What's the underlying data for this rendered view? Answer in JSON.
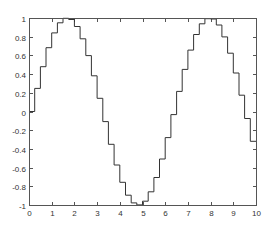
{
  "chart_data": {
    "type": "line",
    "style": "stairs",
    "title": "",
    "xlabel": "",
    "ylabel": "",
    "xlim": [
      0,
      10
    ],
    "ylim": [
      -1,
      1
    ],
    "grid": false,
    "legend": null,
    "x_ticks": [
      0,
      1,
      2,
      3,
      4,
      5,
      6,
      7,
      8,
      9,
      10
    ],
    "y_ticks": [
      -1,
      -0.8,
      -0.6,
      -0.4,
      -0.2,
      0,
      0.2,
      0.4,
      0.6,
      0.8,
      1
    ],
    "x_tick_labels": [
      "0",
      "1",
      "2",
      "3",
      "4",
      "5",
      "6",
      "7",
      "8",
      "9",
      "10"
    ],
    "y_tick_labels": [
      "-1",
      "-0.8",
      "-0.6",
      "-0.4",
      "-0.2",
      "0",
      "0.2",
      "0.4",
      "0.6",
      "0.8",
      "1"
    ],
    "series": [
      {
        "name": "sin(x) stairs",
        "color": "#333333",
        "x": [
          0,
          0.25,
          0.5,
          0.75,
          1,
          1.25,
          1.5,
          1.75,
          2,
          2.25,
          2.5,
          2.75,
          3,
          3.25,
          3.5,
          3.75,
          4,
          4.25,
          4.5,
          4.75,
          5,
          5.25,
          5.5,
          5.75,
          6,
          6.25,
          6.5,
          6.75,
          7,
          7.25,
          7.5,
          7.75,
          8,
          8.25,
          8.5,
          8.75,
          9,
          9.25,
          9.5,
          9.75
        ],
        "values": [
          0,
          0.247,
          0.479,
          0.682,
          0.841,
          0.949,
          0.997,
          0.984,
          0.909,
          0.778,
          0.598,
          0.382,
          0.141,
          -0.108,
          -0.351,
          -0.572,
          -0.757,
          -0.895,
          -0.978,
          -0.999,
          -0.959,
          -0.859,
          -0.706,
          -0.508,
          -0.279,
          -0.033,
          0.215,
          0.45,
          0.657,
          0.823,
          0.938,
          0.993,
          0.989,
          0.925,
          0.798,
          0.624,
          0.412,
          0.174,
          -0.075,
          -0.319
        ]
      }
    ]
  },
  "colors": {
    "axes": "#555555",
    "line": "#333333",
    "background": "#ffffff"
  },
  "layout": {
    "plot_left": 29,
    "plot_right": 256,
    "plot_top": 18,
    "plot_bottom": 205
  }
}
